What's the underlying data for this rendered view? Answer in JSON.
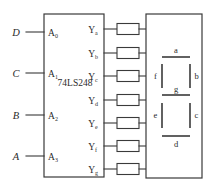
{
  "diagram": {
    "line_color": "#3a3a3a",
    "text_color": "#2b2b2b",
    "background": "#ffffff"
  },
  "chip": {
    "label": "74LS248",
    "inputs": [
      {
        "signal": "D",
        "pin": "A",
        "pin_sub": "0",
        "y": 32
      },
      {
        "signal": "C",
        "pin": "A",
        "pin_sub": "1",
        "y": 73
      },
      {
        "signal": "B",
        "pin": "A",
        "pin_sub": "2",
        "y": 115
      },
      {
        "signal": "A",
        "pin": "A",
        "pin_sub": "3",
        "y": 156
      }
    ],
    "outputs": [
      {
        "pin": "Y",
        "pin_sub": "a",
        "y": 29
      },
      {
        "pin": "Y",
        "pin_sub": "b",
        "y": 53
      },
      {
        "pin": "Y",
        "pin_sub": "c",
        "y": 76
      },
      {
        "pin": "Y",
        "pin_sub": "d",
        "y": 100
      },
      {
        "pin": "Y",
        "pin_sub": "e",
        "y": 123
      },
      {
        "pin": "Y",
        "pin_sub": "f",
        "y": 146
      },
      {
        "pin": "Y",
        "pin_sub": "g",
        "y": 169
      }
    ]
  },
  "resistors": [
    {
      "name": "resistor-a",
      "y": 29
    },
    {
      "name": "resistor-b",
      "y": 53
    },
    {
      "name": "resistor-c",
      "y": 76
    },
    {
      "name": "resistor-d",
      "y": 100
    },
    {
      "name": "resistor-e",
      "y": 123
    },
    {
      "name": "resistor-f",
      "y": 146
    },
    {
      "name": "resistor-g",
      "y": 169
    }
  ],
  "display": {
    "segments": [
      {
        "id": "a",
        "label": "a",
        "orientation": "horizontal"
      },
      {
        "id": "b",
        "label": "b",
        "orientation": "vertical"
      },
      {
        "id": "c",
        "label": "c",
        "orientation": "vertical"
      },
      {
        "id": "d",
        "label": "d",
        "orientation": "horizontal"
      },
      {
        "id": "e",
        "label": "e",
        "orientation": "vertical"
      },
      {
        "id": "f",
        "label": "f",
        "orientation": "vertical"
      },
      {
        "id": "g",
        "label": "g",
        "orientation": "horizontal"
      }
    ]
  }
}
